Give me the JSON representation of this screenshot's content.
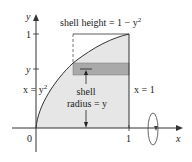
{
  "figure": {
    "type": "shell-method-diagram",
    "curve_label": "x = y",
    "curve_label_exp": "2",
    "line_label": "x = 1",
    "shell_height_label": "shell height = 1 − y",
    "shell_height_exp": "2",
    "shell_radius_label_1": "shell",
    "shell_radius_label_2": "radius = y",
    "axes": {
      "x_label": "x",
      "y_label": "y",
      "origin_label": "0",
      "x_tick_1": "1",
      "y_tick_1": "1",
      "y_tick_y": "y"
    },
    "colors": {
      "region_fill": "#e6e6e6",
      "strip_fill": "#a9a9a9",
      "line": "#333333"
    }
  }
}
